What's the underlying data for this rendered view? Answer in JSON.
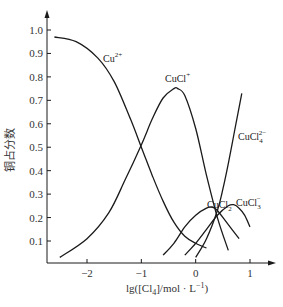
{
  "chart_data": {
    "type": "line",
    "title": "",
    "xlabel": "lg([Cl₄]/mol · L⁻¹)",
    "ylabel": "铜占分数",
    "xlim": [
      -2.7,
      1.3
    ],
    "ylim": [
      0,
      1.05
    ],
    "x_ticks": [
      -2,
      -1,
      0,
      1
    ],
    "x_tick_labels": [
      "−2",
      "−1",
      "0",
      "1"
    ],
    "y_ticks": [
      0.1,
      0.2,
      0.3,
      0.4,
      0.5,
      0.6,
      0.7,
      0.8,
      0.9,
      1.0
    ],
    "y_tick_labels": [
      "0.1",
      "0.2",
      "0.3",
      "0.4",
      "0.5",
      "0.6",
      "0.7",
      "0.8",
      "0.9",
      "1.0"
    ],
    "grid": false,
    "legend": "inline labels",
    "series": [
      {
        "name": "Cu2+",
        "label": "Cu",
        "label_sup": "2+",
        "label_sub": "",
        "x": [
          -2.6,
          -2.2,
          -1.8,
          -1.5,
          -1.2,
          -1.0,
          -0.8,
          -0.6,
          -0.4,
          -0.2,
          0.0,
          0.2
        ],
        "y": [
          0.97,
          0.95,
          0.88,
          0.78,
          0.62,
          0.5,
          0.38,
          0.27,
          0.18,
          0.12,
          0.09,
          0.07
        ]
      },
      {
        "name": "CuCl+",
        "label": "CuCl",
        "label_sup": "+",
        "label_sub": "",
        "x": [
          -2.5,
          -2.0,
          -1.6,
          -1.3,
          -1.0,
          -0.8,
          -0.6,
          -0.4,
          -0.33,
          -0.2,
          0.0,
          0.2,
          0.4,
          0.6
        ],
        "y": [
          0.03,
          0.11,
          0.22,
          0.36,
          0.51,
          0.62,
          0.71,
          0.75,
          0.75,
          0.72,
          0.58,
          0.38,
          0.2,
          0.06
        ]
      },
      {
        "name": "CuCl2",
        "label": "CuCl",
        "label_sup": "",
        "label_sub": "2",
        "x": [
          -0.6,
          -0.4,
          -0.2,
          0.0,
          0.2,
          0.3,
          0.4,
          0.6,
          0.8
        ],
        "y": [
          0.04,
          0.09,
          0.16,
          0.21,
          0.24,
          0.245,
          0.23,
          0.17,
          0.11
        ]
      },
      {
        "name": "CuCl3-",
        "label": "CuCl",
        "label_sup": "−",
        "label_sub": "3",
        "x": [
          -0.2,
          0.0,
          0.2,
          0.4,
          0.6,
          0.7,
          0.8,
          0.9,
          1.0
        ],
        "y": [
          0.04,
          0.09,
          0.15,
          0.21,
          0.25,
          0.255,
          0.24,
          0.21,
          0.16
        ]
      },
      {
        "name": "CuCl4 2-",
        "label": "CuCl",
        "label_sup": "2−",
        "label_sub": "4",
        "x": [
          0.0,
          0.2,
          0.4,
          0.5,
          0.6,
          0.7,
          0.8,
          0.85
        ],
        "y": [
          0.03,
          0.11,
          0.23,
          0.32,
          0.43,
          0.55,
          0.67,
          0.73
        ]
      }
    ]
  },
  "labels": {
    "ylabel": "铜占分数",
    "xlabel_main": "lg([Cl",
    "xlabel_sub": "4",
    "xlabel_rest": "]/mol · L",
    "xlabel_sup": "−1",
    "xlabel_close": ")"
  }
}
